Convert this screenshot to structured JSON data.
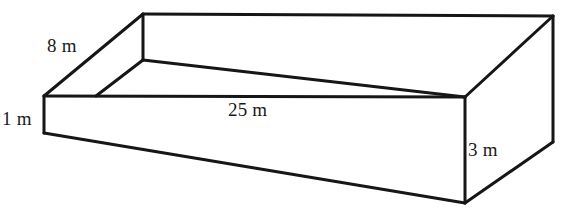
{
  "figure": {
    "name": "open-rectangular-box",
    "stroke_color": "#161616",
    "fill_color": "#ffffff",
    "text_color": "#1a1a1a",
    "canvas": {
      "width": 568,
      "height": 212
    }
  },
  "labels": {
    "width": "8 m",
    "length": "25 m",
    "depth": "1 m",
    "height": "3 m"
  },
  "geometry": {
    "top_rim": {
      "back_left": [
        143,
        14
      ],
      "back_right": [
        553,
        16
      ],
      "front_right": [
        465,
        97
      ],
      "front_left": [
        44,
        96
      ]
    },
    "bottom": {
      "front_left": [
        44,
        133
      ],
      "front_right": [
        465,
        203
      ],
      "back_right": [
        553,
        142
      ]
    },
    "inner_floor": {
      "back_left": [
        143,
        60
      ],
      "front_left": [
        96,
        96
      ],
      "front_right": [
        465,
        97
      ]
    }
  }
}
